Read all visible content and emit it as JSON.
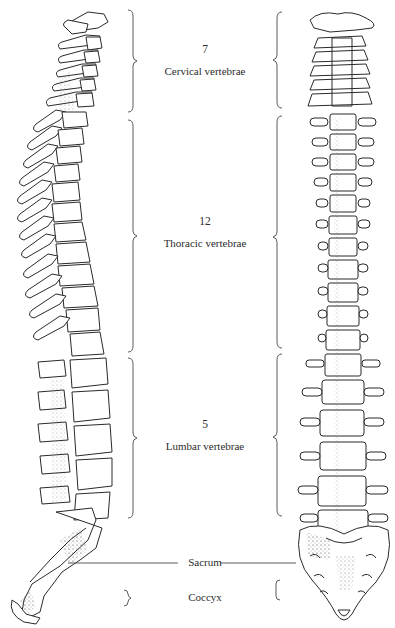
{
  "figure": {
    "views": [
      "lateral-view",
      "anterior-view"
    ]
  },
  "regions": [
    {
      "id": "cervical",
      "count": "7",
      "name": "Cervical vertebrae"
    },
    {
      "id": "thoracic",
      "count": "12",
      "name": "Thoracic vertebrae"
    },
    {
      "id": "lumbar",
      "count": "5",
      "name": "Lumbar vertebrae"
    },
    {
      "id": "sacrum",
      "count": "",
      "name": "Sacrum"
    },
    {
      "id": "coccyx",
      "count": "",
      "name": "Coccyx"
    }
  ],
  "colors": {
    "ink": "#2a2a2a",
    "bone_fill": "#ffffff",
    "shade": "#555555",
    "background": "#ffffff"
  }
}
